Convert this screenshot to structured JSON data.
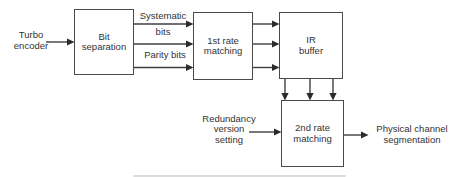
{
  "diagram": {
    "nodes": {
      "turbo_encoder": {
        "label": "Turbo\nencoder"
      },
      "bit_separation": {
        "label": "Bit\nseparation"
      },
      "first_rate_matching": {
        "label": "1st rate\nmatching"
      },
      "ir_buffer": {
        "label": "IR\nbuffer"
      },
      "second_rate_matching": {
        "label": "2nd rate\nmatching"
      },
      "redundancy_version_setting": {
        "label": "Redundancy\nversion\nsetting"
      },
      "physical_channel_segmentation": {
        "label": "Physical channel\nsegmentation"
      }
    },
    "edge_labels": {
      "systematic_top": "Systematic",
      "systematic_bottom": "bits",
      "parity": "Parity bits"
    },
    "colors": {
      "background": "#ffffff",
      "box_border": "#4a4a4a",
      "line": "#3f3f3f",
      "arrowhead": "#2b2b2b",
      "text": "#333333"
    }
  }
}
